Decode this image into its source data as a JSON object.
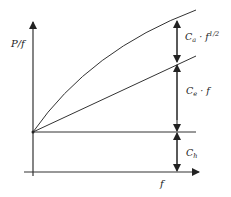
{
  "diagram": {
    "axes": {
      "y_label": "P/f",
      "x_label": "f"
    },
    "components": [
      {
        "id": "hysteresis",
        "label_main": "C",
        "label_sub": "h",
        "label_rest": ""
      },
      {
        "id": "eddy",
        "label_main": "C",
        "label_sub": "e",
        "label_rest": " · f"
      },
      {
        "id": "anomalous",
        "label_main": "C",
        "label_sub": "a",
        "label_rest": " · f",
        "label_sup": "1/2"
      }
    ],
    "curves": [
      {
        "name": "constant",
        "shape": "horizontal line"
      },
      {
        "name": "linear",
        "shape": "straight line"
      },
      {
        "name": "square-root",
        "shape": "concave curve"
      }
    ],
    "colors": {
      "line": "#333333",
      "text": "#222222",
      "background": "#ffffff"
    }
  }
}
